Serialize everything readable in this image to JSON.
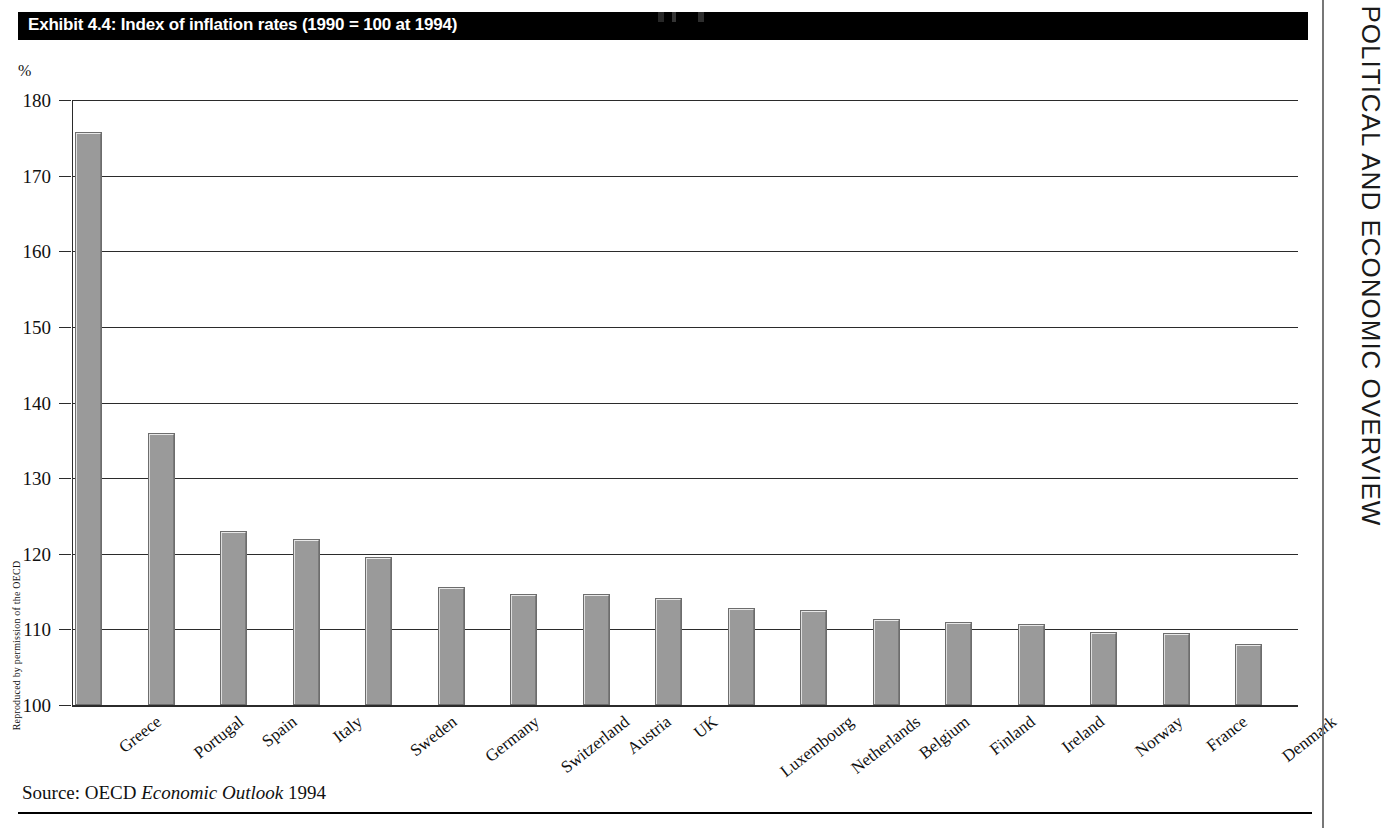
{
  "exhibit": {
    "title": "Exhibit 4.4: Index of inflation rates (1990 = 100 at 1994)",
    "source_prefix": "Source: OECD",
    "source_italic": "Economic Outlook",
    "source_suffix": "1994",
    "credit": "Reproduced by permission of the OECD",
    "running_head": "POLITICAL AND ECONOMIC OVERVIEW",
    "unit_label": "%"
  },
  "colors": {
    "bar_fill": "#9a9a9a",
    "bar_highlight": "#e8e8e8",
    "bar_shadow": "#7a7a7a",
    "axis": "#2b2b2b",
    "title_bg": "#000000",
    "title_fg": "#ffffff"
  },
  "chart_data": {
    "type": "bar",
    "title": "Exhibit 4.4: Index of inflation rates (1990 = 100 at 1994)",
    "xlabel": "",
    "ylabel": "%",
    "ylim": [
      100,
      180
    ],
    "yticks": [
      100,
      110,
      120,
      130,
      140,
      150,
      160,
      170,
      180
    ],
    "grid": true,
    "legend": "none",
    "categories": [
      "Greece",
      "Portugal",
      "Spain",
      "Italy",
      "Sweden",
      "Germany",
      "Switzerland",
      "Austria",
      "UK",
      "Luxembourg",
      "Netherlands",
      "Belgium",
      "Finland",
      "Ireland",
      "Norway",
      "France",
      "Denmark"
    ],
    "values": [
      175.8,
      136.0,
      123.0,
      122.0,
      119.6,
      115.6,
      114.7,
      114.7,
      114.2,
      112.8,
      112.5,
      111.4,
      111.0,
      110.7,
      109.6,
      109.5,
      108.1
    ]
  }
}
